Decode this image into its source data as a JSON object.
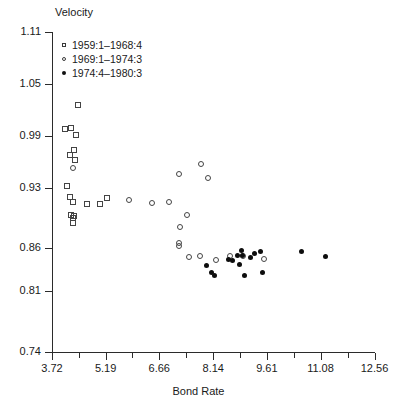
{
  "chart_data": {
    "type": "scatter",
    "title": "",
    "xlabel": "Bond Rate",
    "ylabel": "Velocity",
    "xlim": [
      3.72,
      12.56
    ],
    "ylim": [
      0.74,
      1.11
    ],
    "grid": false,
    "legend_position": "top-left",
    "xticks": [
      "3.72",
      "5.19",
      "6.66",
      "8.14",
      "9.61",
      "11.08",
      "12.56"
    ],
    "xtick_values": [
      3.72,
      5.19,
      6.66,
      8.14,
      9.61,
      11.08,
      12.56
    ],
    "yticks": [
      "1.11",
      "1.05",
      "0.99",
      "0.93",
      "0.86",
      "0.81",
      "0.74"
    ],
    "ytick_values": [
      1.11,
      1.05,
      0.99,
      0.93,
      0.86,
      0.81,
      0.74
    ],
    "series": [
      {
        "name": "1959:1–1968:4",
        "marker": "open-square",
        "points": [
          [
            4.43,
            1.026
          ],
          [
            4.09,
            0.998
          ],
          [
            4.25,
            0.999
          ],
          [
            4.39,
            0.991
          ],
          [
            4.22,
            0.968
          ],
          [
            4.33,
            0.974
          ],
          [
            4.34,
            0.962
          ],
          [
            4.12,
            0.932
          ],
          [
            4.22,
            0.919
          ],
          [
            4.3,
            0.914
          ],
          [
            4.68,
            0.911
          ],
          [
            5.03,
            0.911
          ],
          [
            5.23,
            0.918
          ],
          [
            4.25,
            0.898
          ],
          [
            4.29,
            0.895
          ],
          [
            4.33,
            0.897
          ],
          [
            4.3,
            0.889
          ]
        ]
      },
      {
        "name": "1969:1–1974:3",
        "marker": "open-circle",
        "points": [
          [
            4.3,
            0.953
          ],
          [
            5.82,
            0.916
          ],
          [
            6.45,
            0.912
          ],
          [
            6.93,
            0.913
          ],
          [
            7.2,
            0.946
          ],
          [
            7.8,
            0.957
          ],
          [
            8.0,
            0.941
          ],
          [
            7.43,
            0.898
          ],
          [
            7.22,
            0.884
          ],
          [
            7.2,
            0.866
          ],
          [
            7.19,
            0.863
          ],
          [
            7.47,
            0.85
          ],
          [
            7.77,
            0.851
          ],
          [
            8.22,
            0.846
          ],
          [
            8.61,
            0.851
          ],
          [
            8.95,
            0.851
          ],
          [
            9.53,
            0.848
          ]
        ]
      },
      {
        "name": "1974:4–1980:3",
        "marker": "filled-circle",
        "points": [
          [
            7.96,
            0.84
          ],
          [
            8.1,
            0.832
          ],
          [
            8.18,
            0.828
          ],
          [
            8.55,
            0.847
          ],
          [
            8.68,
            0.846
          ],
          [
            8.8,
            0.852
          ],
          [
            8.86,
            0.841
          ],
          [
            8.92,
            0.857
          ],
          [
            8.95,
            0.852
          ],
          [
            9.01,
            0.829
          ],
          [
            9.15,
            0.849
          ],
          [
            9.28,
            0.854
          ],
          [
            9.43,
            0.856
          ],
          [
            9.49,
            0.832
          ],
          [
            10.55,
            0.856
          ],
          [
            11.22,
            0.85
          ]
        ]
      }
    ]
  },
  "legend": {
    "entries": [
      {
        "label": "1959:1–1968:4",
        "marker": "open-square"
      },
      {
        "label": "1969:1–1974:3",
        "marker": "open-circle"
      },
      {
        "label": "1974:4–1980:3",
        "marker": "filled-circle"
      }
    ]
  }
}
